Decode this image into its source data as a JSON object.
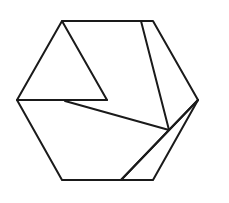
{
  "diagram": {
    "title": "",
    "stroke_color": "#1a1a1a",
    "background": "#ffffff",
    "hexagon": {
      "vertices": [
        [
          62,
          21
        ],
        [
          153,
          21
        ],
        [
          198,
          100
        ],
        [
          153,
          180
        ],
        [
          62,
          180
        ],
        [
          17,
          100
        ]
      ]
    },
    "inner_segments": [
      {
        "from": [
          62,
          21
        ],
        "to": [
          107,
          100
        ]
      },
      {
        "from": [
          107,
          100
        ],
        "to": [
          17,
          100
        ]
      },
      {
        "from": [
          65,
          101
        ],
        "to": [
          169,
          130
        ]
      },
      {
        "from": [
          141,
          21
        ],
        "to": [
          169,
          130
        ]
      },
      {
        "from": [
          169,
          130
        ],
        "to": [
          198,
          100
        ]
      },
      {
        "from": [
          169,
          130
        ],
        "to": [
          121,
          180
        ]
      },
      {
        "from": [
          198,
          100
        ],
        "to": [
          121,
          180
        ]
      }
    ]
  }
}
